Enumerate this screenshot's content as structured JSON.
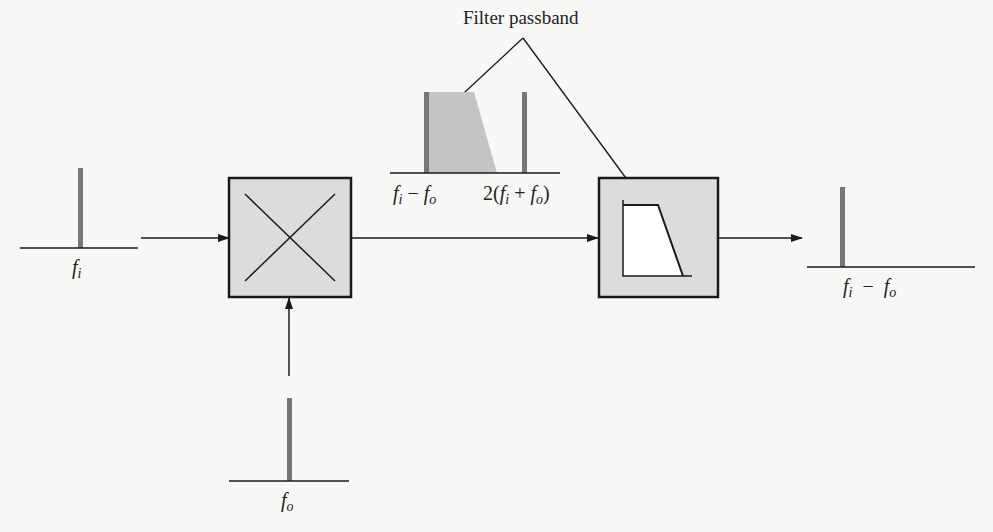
{
  "diagram": {
    "title": "Filter passband",
    "input_spectrum": {
      "label_main": "f",
      "label_sub": "i"
    },
    "lo_spectrum": {
      "label_main": "f",
      "label_sub": "o"
    },
    "mixer_output_spectrum": {
      "label_difference": {
        "a": "f",
        "a_sub": "i",
        "op": " − ",
        "b": "f",
        "b_sub": "o"
      },
      "label_sum": {
        "prefix": "2(",
        "a": "f",
        "a_sub": "i",
        "op": " + ",
        "b": "f",
        "b_sub": "o",
        "suffix": ")"
      }
    },
    "output_spectrum": {
      "label": {
        "a": "f",
        "a_sub": "i",
        "op": "  −  ",
        "b": "f",
        "b_sub": "o"
      }
    },
    "blocks": [
      "mixer",
      "bandpass-filter"
    ],
    "colors": {
      "line": "#1a1a1a",
      "spectral_bar": "#777777",
      "block_fill": "#dcdcdc",
      "passband_fill": "#c4c4c4",
      "background": "#f7f7f5"
    }
  }
}
